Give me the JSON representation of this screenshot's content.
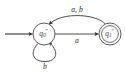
{
  "diagram": {
    "background_color": "#ffffff",
    "stroke_color": "#3a3a3a",
    "states": [
      {
        "id": "q0",
        "name": "q0-state",
        "base_label": "q",
        "subscript": "0",
        "prime": "″",
        "full_label": "q0″",
        "accepting": false,
        "is_start": true,
        "cx": 44,
        "cy": 34,
        "r": 11
      },
      {
        "id": "q1",
        "name": "q1-state",
        "base_label": "q",
        "subscript": "1",
        "prime": "″",
        "full_label": "q1″",
        "accepting": true,
        "is_start": false,
        "cx": 110,
        "cy": 34,
        "r_outer": 11,
        "r_inner": 8.4
      }
    ],
    "transitions": [
      {
        "id": "t-top",
        "from": "q1",
        "to": "q0",
        "label": "a, b",
        "symbols": [
          "a",
          "b"
        ],
        "shape": "arc-above",
        "label_x": 77,
        "label_y": 10
      },
      {
        "id": "t-mid",
        "from": "q0",
        "to": "q1",
        "label": "a",
        "symbols": [
          "a"
        ],
        "shape": "straight",
        "label_x": 77,
        "label_y": 41
      },
      {
        "id": "t-loop",
        "from": "q0",
        "to": "q0",
        "label": "b",
        "symbols": [
          "b"
        ],
        "shape": "self-loop-below",
        "label_x": 45,
        "label_y": 67
      }
    ],
    "start_arrow": {
      "name": "start-arrow",
      "x1": 5,
      "y1": 34,
      "x2": 33,
      "y2": 34
    },
    "alphabet": [
      "a",
      "b"
    ]
  }
}
